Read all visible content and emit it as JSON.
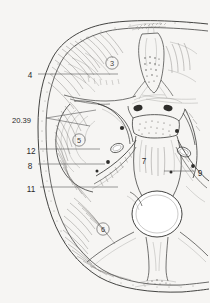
{
  "figure": {
    "background_color": "#f6f5f3",
    "ink_color": "#3a3a38",
    "label_color": "#2b2b2b",
    "width": 210,
    "height": 303
  },
  "callouts": [
    {
      "id": "callout-4",
      "text": "4",
      "x": 30,
      "y": 75,
      "side": "left",
      "leader": [
        [
          38,
          74
        ],
        [
          118,
          74
        ]
      ]
    },
    {
      "id": "callout-2039",
      "text": "20.39",
      "x": 12,
      "y": 120,
      "side": "left",
      "leader_fork": {
        "origin": [
          46,
          118
        ],
        "tips": [
          [
            96,
            110
          ],
          [
            90,
            126
          ]
        ]
      }
    },
    {
      "id": "callout-12",
      "text": "12",
      "x": 25,
      "y": 151,
      "side": "left",
      "leader": [
        [
          40,
          149
        ],
        [
          100,
          149
        ]
      ]
    },
    {
      "id": "callout-8",
      "text": "8",
      "x": 30,
      "y": 166,
      "side": "left",
      "leader": [
        [
          38,
          164
        ],
        [
          105,
          164
        ]
      ]
    },
    {
      "id": "callout-11",
      "text": "11",
      "x": 26,
      "y": 189,
      "side": "left",
      "leader": [
        [
          40,
          187
        ],
        [
          118,
          187
        ]
      ]
    },
    {
      "id": "callout-9",
      "text": "9",
      "x": 196,
      "y": 173,
      "side": "right",
      "leader": [
        [
          194,
          171
        ],
        [
          164,
          171
        ]
      ]
    }
  ],
  "region_markers": [
    {
      "id": "region-3",
      "text": "3",
      "x": 112,
      "y": 63,
      "circled": true,
      "radius": 6.2
    },
    {
      "id": "region-5",
      "text": "5",
      "x": 79,
      "y": 140,
      "circled": true,
      "radius": 6.2
    },
    {
      "id": "region-6",
      "text": "6",
      "x": 103,
      "y": 229,
      "circled": true,
      "radius": 6.2
    },
    {
      "id": "region-7",
      "text": "7",
      "x": 144,
      "y": 161,
      "circled": false,
      "radius": 0
    }
  ]
}
